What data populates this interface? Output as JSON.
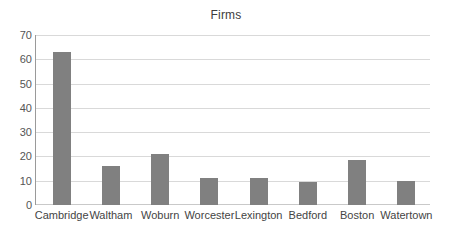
{
  "chart_data": {
    "type": "bar",
    "title": "Firms",
    "xlabel": "",
    "ylabel": "",
    "categories": [
      "Cambridge",
      "Waltham",
      "Woburn",
      "Worcester",
      "Lexington",
      "Bedford",
      "Boston",
      "Watertown"
    ],
    "values": [
      63,
      16,
      21,
      11,
      11,
      9.5,
      18.5,
      9.7
    ],
    "ylim": [
      0,
      70
    ],
    "yticks": [
      0,
      10,
      20,
      30,
      40,
      50,
      60,
      70
    ],
    "ytick_labels": [
      "0",
      "10",
      "20",
      "30",
      "40",
      "50",
      "60",
      "70"
    ],
    "grid": true,
    "legend": null,
    "bar_color": "#808080",
    "grid_color": "#d9d9d9",
    "axis_color": "#9a9a9a",
    "background": "#ffffff"
  }
}
